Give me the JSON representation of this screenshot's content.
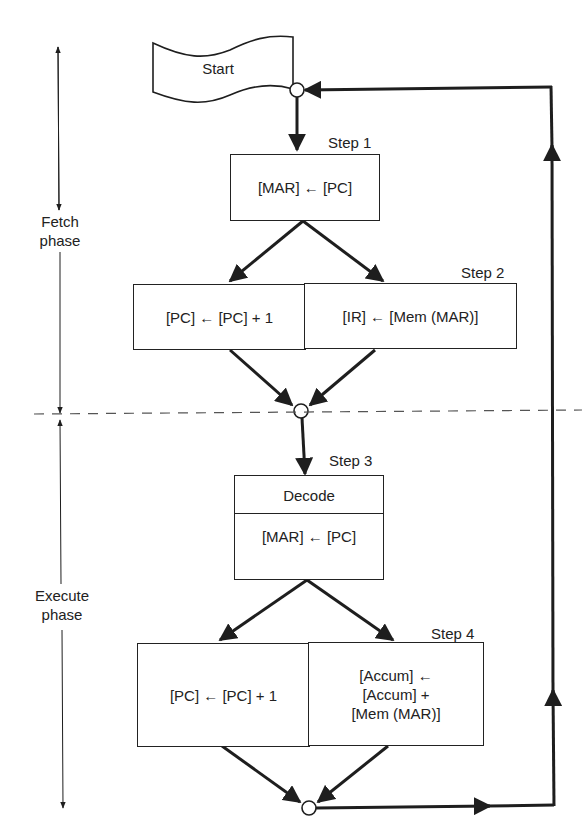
{
  "start": {
    "label": "Start"
  },
  "phases": {
    "fetch": {
      "line1": "Fetch",
      "line2": "phase"
    },
    "execute": {
      "line1": "Execute",
      "line2": "phase"
    }
  },
  "steps": {
    "step1": {
      "label": "Step 1",
      "op": "[MAR] ← [PC]"
    },
    "step2": {
      "label": "Step 2",
      "left_op": "[PC] ← [PC] + 1",
      "right_op": "[IR] ← [Mem (MAR)]"
    },
    "step3": {
      "label": "Step 3",
      "header": "Decode",
      "op": "[MAR] ← [PC]"
    },
    "step4": {
      "label": "Step 4",
      "left_op": "[PC] ← [PC] + 1",
      "right_op_lines": [
        "[Accum] ←",
        "[Accum] +",
        "[Mem (MAR)]"
      ]
    }
  },
  "colors": {
    "line": "#1e1e1e",
    "dash": "#555555",
    "background": "#ffffff"
  }
}
